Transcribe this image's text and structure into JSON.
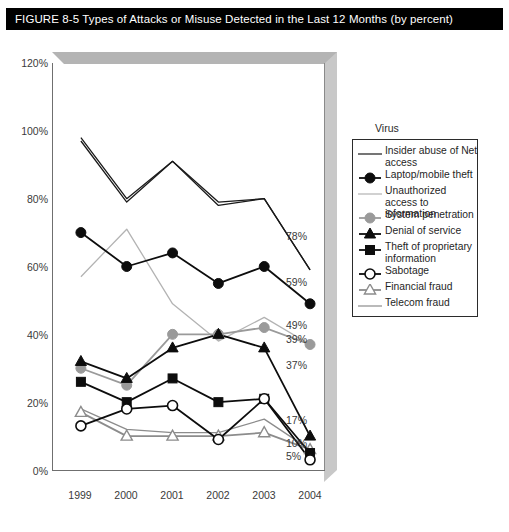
{
  "title": {
    "figure_number": "FIGURE 8-5",
    "text": "Types of Attacks or Misuse Detected in the Last 12 Months (by percent)",
    "full": "FIGURE 8-5  Types of Attacks or Misuse Detected in the Last 12 Months (by percent)"
  },
  "legend": {
    "heading": "Virus",
    "entries": [
      {
        "label": "Insider abuse of Net access",
        "marker": "none",
        "color": "#1a1a1a",
        "line": "solid-thin"
      },
      {
        "label": "Laptop/mobile theft",
        "marker": "filled-circle",
        "color": "#0d0d0d",
        "line": "solid"
      },
      {
        "label": "Unauthorized access to information",
        "marker": "none",
        "color": "#b3b3b3",
        "line": "solid-thin"
      },
      {
        "label": "System penetration",
        "marker": "filled-circle",
        "color": "#9a9a9a",
        "line": "solid"
      },
      {
        "label": "Denial of service",
        "marker": "filled-triangle",
        "color": "#0d0d0d",
        "line": "solid"
      },
      {
        "label": "Theft of proprietary information",
        "marker": "filled-square",
        "color": "#0d0d0d",
        "line": "solid"
      },
      {
        "label": "Sabotage",
        "marker": "open-circle",
        "color": "#0d0d0d",
        "line": "solid"
      },
      {
        "label": "Financial fraud",
        "marker": "open-triangle",
        "color": "#8c8c8c",
        "line": "solid"
      },
      {
        "label": "Telecom fraud",
        "marker": "none",
        "color": "#8c8c8c",
        "line": "solid-thin"
      }
    ]
  },
  "end_labels": [
    {
      "value": "78%",
      "y": 236
    },
    {
      "value": "59%",
      "y": 282
    },
    {
      "value": "49%",
      "y": 325
    },
    {
      "value": "39%",
      "y": 339
    },
    {
      "value": "37%",
      "y": 365
    },
    {
      "value": "17%",
      "y": 420
    },
    {
      "value": "10%",
      "y": 443
    },
    {
      "value": "5%",
      "y": 456
    }
  ],
  "chart_data": {
    "type": "line",
    "title": "Types of Attacks or Misuse Detected in the Last 12 Months (by percent)",
    "xlabel": "",
    "ylabel": "",
    "categories": [
      "1999",
      "2000",
      "2001",
      "2002",
      "2003",
      "2004"
    ],
    "x": [
      1999,
      2000,
      2001,
      2002,
      2003,
      2004
    ],
    "ylim": [
      0,
      120
    ],
    "ytick_labels": [
      "0%",
      "20%",
      "40%",
      "60%",
      "80%",
      "100%",
      "120%"
    ],
    "yticks": [
      0,
      20,
      40,
      60,
      80,
      100,
      120
    ],
    "grid": false,
    "legend_position": "right",
    "series": [
      {
        "name": "Virus",
        "values": [
          98,
          80,
          91,
          79,
          80,
          59
        ],
        "marker": "none",
        "color": "#1a1a1a"
      },
      {
        "name": "Insider abuse of Net access",
        "values": [
          97,
          79,
          91,
          78,
          80,
          59
        ],
        "marker": "none",
        "color": "#1a1a1a"
      },
      {
        "name": "Laptop/mobile theft",
        "values": [
          70,
          60,
          64,
          55,
          60,
          49
        ],
        "marker": "filled-circle",
        "color": "#0d0d0d"
      },
      {
        "name": "Unauthorized access to information",
        "values": [
          57,
          71,
          49,
          38,
          45,
          37
        ],
        "marker": "none",
        "color": "#b3b3b3"
      },
      {
        "name": "System penetration",
        "values": [
          30,
          25,
          40,
          40,
          42,
          37
        ],
        "marker": "filled-circle",
        "color": "#9a9a9a"
      },
      {
        "name": "Denial of service",
        "values": [
          32,
          27,
          36,
          40,
          36,
          10
        ],
        "marker": "filled-triangle",
        "color": "#0d0d0d"
      },
      {
        "name": "Theft of proprietary information",
        "values": [
          26,
          20,
          27,
          20,
          21,
          5
        ],
        "marker": "filled-square",
        "color": "#0d0d0d"
      },
      {
        "name": "Sabotage",
        "values": [
          13,
          18,
          19,
          9,
          21,
          3
        ],
        "marker": "open-circle",
        "color": "#0d0d0d"
      },
      {
        "name": "Financial fraud",
        "values": [
          17,
          10,
          10,
          10,
          11,
          6
        ],
        "marker": "open-triangle",
        "color": "#8c8c8c"
      },
      {
        "name": "Telecom fraud",
        "values": [
          18,
          12,
          11,
          11,
          15,
          6
        ],
        "marker": "none",
        "color": "#8c8c8c"
      }
    ],
    "end_value_labels": [
      "78%",
      "59%",
      "49%",
      "39%",
      "37%",
      "17%",
      "10%",
      "5%"
    ]
  },
  "colors": {
    "title_bar": "#000000",
    "title_text": "#ffffff",
    "plot_bevel": "#b4b4b4",
    "axis": "#6f6f6f",
    "dark_series": "#0d0d0d",
    "gray_series": "#9a9a9a",
    "light_gray_series": "#b3b3b3"
  }
}
